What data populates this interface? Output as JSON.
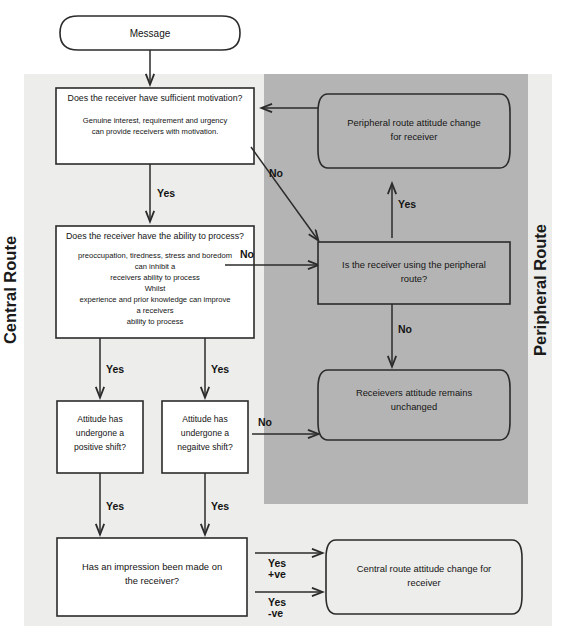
{
  "diagram": {
    "colors": {
      "page_background": "#ffffff",
      "outer_panel": "#ededeb",
      "peripheral_panel": "#b4b4b4",
      "node_fill": "#ffffff",
      "node_stroke": "#2b2b2b",
      "text": "#141414"
    },
    "side_labels": {
      "left": "Central Route",
      "right": "Peripheral Route"
    },
    "nodes": {
      "message": {
        "shape": "rounded-pill",
        "label": "Message"
      },
      "motivation": {
        "shape": "rectangle",
        "heading": "Does the receiver have sufficient motivation?",
        "body_line1": "Genuine interest, requirement and urgency",
        "body_line2": "can provide receivers with motivation."
      },
      "ability": {
        "shape": "rectangle",
        "heading": "Does the receiver have the ability to process?",
        "body_line1": "preoccupation, tiredness, stress and boredom",
        "body_line2": "can inhibit a",
        "body_line3": "receivers ability to process",
        "body_line4": "Whilst",
        "body_line5": "experience and prior knowledge can improve",
        "body_line6": "a receivers",
        "body_line7": "ability to process"
      },
      "positive_shift": {
        "shape": "rectangle",
        "line1": "Attitude has",
        "line2": "undergone a",
        "line3": "positive shift?"
      },
      "negative_shift": {
        "shape": "rectangle",
        "line1": "Attitude has",
        "line2": "undergone a",
        "line3": "negaitve shift?"
      },
      "impression": {
        "shape": "rectangle",
        "line1": "Has an impression been made on",
        "line2": "the receiver?"
      },
      "peripheral_change": {
        "shape": "rounded-pill",
        "line1": "Peripheral route attitude change",
        "line2": "for receiver"
      },
      "peripheral_question": {
        "shape": "rectangle",
        "line1": "Is the receiver using the peripheral",
        "line2": "route?"
      },
      "unchanged": {
        "shape": "rounded-pill",
        "line1": "Receievers attitude remains",
        "line2": "unchanged"
      },
      "central_change": {
        "shape": "rounded-pill",
        "line1": "Central route attitude change for",
        "line2": "receiver"
      }
    },
    "edges": {
      "message_to_motivation": "",
      "motivation_yes": "Yes",
      "motivation_no": "No",
      "ability_no": "No",
      "ability_yes_left": "Yes",
      "ability_yes_right": "Yes",
      "negative_no": "No",
      "positive_yes": "Yes",
      "negative_yes": "Yes",
      "peripheral_yes": "Yes",
      "peripheral_no": "No",
      "impression_yes_pos_line1": "Yes",
      "impression_yes_pos_line2": "+ve",
      "impression_yes_neg_line1": "Yes",
      "impression_yes_neg_line2": "-ve"
    }
  }
}
